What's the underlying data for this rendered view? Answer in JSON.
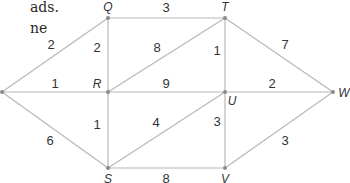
{
  "text_fragments": [
    {
      "text": "ads.",
      "x": 30,
      "y": 0
    },
    {
      "text": "ne",
      "x": 30,
      "y": 21
    }
  ],
  "graph": {
    "nodes": [
      {
        "id": "P",
        "label": "",
        "x": 2,
        "y": 92,
        "lx": 0,
        "ly": 0
      },
      {
        "id": "Q",
        "label": "Q",
        "x": 108,
        "y": 18,
        "lx": 108,
        "ly": 11
      },
      {
        "id": "T",
        "label": "T",
        "x": 225,
        "y": 18,
        "lx": 225,
        "ly": 11
      },
      {
        "id": "R",
        "label": "R",
        "x": 108,
        "y": 92,
        "lx": 97,
        "ly": 88
      },
      {
        "id": "U",
        "label": "U",
        "x": 225,
        "y": 92,
        "lx": 232,
        "ly": 105
      },
      {
        "id": "W",
        "label": "W",
        "x": 333,
        "y": 92,
        "lx": 344,
        "ly": 97
      },
      {
        "id": "S",
        "label": "S",
        "x": 108,
        "y": 168,
        "lx": 108,
        "ly": 183
      },
      {
        "id": "V",
        "label": "V",
        "x": 225,
        "y": 168,
        "lx": 225,
        "ly": 183
      }
    ],
    "edges": [
      {
        "from": "P",
        "to": "Q",
        "weight": "2",
        "lx": 51,
        "ly": 49
      },
      {
        "from": "P",
        "to": "R",
        "weight": "1",
        "lx": 55,
        "ly": 88
      },
      {
        "from": "P",
        "to": "S",
        "weight": "6",
        "lx": 50,
        "ly": 145
      },
      {
        "from": "Q",
        "to": "T",
        "weight": "3",
        "lx": 166,
        "ly": 12
      },
      {
        "from": "Q",
        "to": "R",
        "weight": "2",
        "lx": 97,
        "ly": 52
      },
      {
        "from": "R",
        "to": "T",
        "weight": "8",
        "lx": 157,
        "ly": 52
      },
      {
        "from": "T",
        "to": "U",
        "weight": "1",
        "lx": 217,
        "ly": 55
      },
      {
        "from": "T",
        "to": "W",
        "weight": "7",
        "lx": 285,
        "ly": 49
      },
      {
        "from": "R",
        "to": "U",
        "weight": "9",
        "lx": 166,
        "ly": 88
      },
      {
        "from": "U",
        "to": "W",
        "weight": "2",
        "lx": 272,
        "ly": 88
      },
      {
        "from": "R",
        "to": "S",
        "weight": "1",
        "lx": 97,
        "ly": 129
      },
      {
        "from": "S",
        "to": "U",
        "weight": "4",
        "lx": 156,
        "ly": 127
      },
      {
        "from": "U",
        "to": "V",
        "weight": "3",
        "lx": 217,
        "ly": 126
      },
      {
        "from": "V",
        "to": "W",
        "weight": "3",
        "lx": 285,
        "ly": 145
      },
      {
        "from": "S",
        "to": "V",
        "weight": "8",
        "lx": 166,
        "ly": 183
      }
    ]
  }
}
